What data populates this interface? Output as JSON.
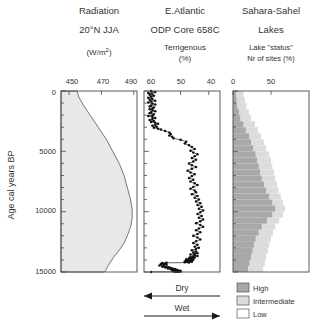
{
  "figure": {
    "yaxis_label": "Age cal years BP",
    "y_ticks": [
      "0",
      "5000",
      "10000",
      "15000"
    ],
    "annotations": {
      "dry": "Dry",
      "wet": "Wet"
    }
  },
  "panels": [
    {
      "id": "radiation",
      "title": "Radiation",
      "subtitle": "20°N JJA",
      "units": "(W/m",
      "units_sup": "2",
      "units_close": ")",
      "ticks": [
        "450",
        "470",
        "490"
      ]
    },
    {
      "id": "odp",
      "title": "E.Atlantic",
      "subtitle": "ODP Core 658C",
      "units": "Terrigenous",
      "units2": "(%)",
      "ticks": [
        "60",
        "50",
        "40"
      ]
    },
    {
      "id": "lakes",
      "title": "Sahara-Sahel",
      "subtitle": "Lakes",
      "units": "Lake \"status\"",
      "units2": "Nr of sites (%)",
      "ticks": [
        "0",
        "50"
      ]
    }
  ],
  "legend": {
    "items": [
      {
        "label": "High",
        "color": "#a8a8a8"
      },
      {
        "label": "Intermediate",
        "color": "#dcdcdc"
      },
      {
        "label": "Low",
        "color": "#ffffff"
      }
    ]
  },
  "chart_data": [
    {
      "type": "area",
      "title": "Radiation 20°N JJA",
      "xlabel": "(W/m2)",
      "ylabel": "Age cal years BP",
      "xlim": [
        445,
        492
      ],
      "ylim": [
        0,
        15000
      ],
      "xticks": [
        450,
        470,
        490
      ],
      "yticks": [
        0,
        5000,
        10000,
        15000
      ],
      "grid": false,
      "x": [
        455,
        456,
        459,
        463,
        468,
        473,
        477,
        481,
        484,
        486,
        488,
        489,
        489,
        488,
        486,
        484,
        481,
        478,
        476,
        474,
        473,
        472
      ],
      "y": [
        0,
        500,
        1200,
        2000,
        3000,
        4000,
        5000,
        6000,
        7000,
        8000,
        9000,
        9800,
        10600,
        11300,
        12000,
        12600,
        13200,
        13700,
        14100,
        14500,
        14800,
        15000
      ],
      "baseline": 445
    },
    {
      "type": "line",
      "title": "E.Atlantic ODP Core 658C Terrigenous",
      "xlabel": "Terrigenous (%)",
      "ylabel": "Age cal years BP",
      "xlim": [
        63,
        36
      ],
      "ylim": [
        0,
        15000
      ],
      "xticks": [
        60,
        50,
        40
      ],
      "yticks": [
        0,
        5000,
        10000,
        15000
      ],
      "grid": false,
      "reversed_x": true,
      "markers": true,
      "x": [
        60.5,
        59.0,
        61.5,
        60.0,
        61.0,
        59.5,
        60.5,
        61.5,
        60.0,
        61.0,
        59.0,
        60.5,
        61.5,
        60.0,
        59.0,
        60.5,
        61.0,
        59.5,
        60.0,
        61.0,
        60.0,
        59.0,
        60.5,
        61.0,
        59.5,
        60.0,
        61.5,
        60.0,
        59.0,
        60.0,
        61.0,
        59.5,
        60.5,
        59.0,
        58.0,
        59.0,
        60.0,
        58.5,
        59.5,
        58.0,
        57.0,
        55.5,
        54.0,
        53.5,
        54.0,
        53.0,
        52.5,
        50.0,
        48.0,
        48.5,
        47.0,
        46.0,
        45.0,
        46.5,
        45.5,
        44.0,
        45.0,
        46.0,
        44.5,
        45.5,
        47.0,
        46.0,
        44.5,
        46.0,
        47.5,
        46.5,
        45.0,
        46.0,
        47.0,
        45.5,
        46.5,
        45.0,
        44.0,
        45.5,
        46.5,
        45.0,
        44.5,
        46.0,
        44.0,
        45.0,
        43.5,
        44.5,
        43.0,
        44.0,
        42.5,
        43.5,
        42.0,
        43.0,
        44.0,
        42.5,
        43.5,
        42.0,
        43.0,
        44.5,
        43.0,
        42.0,
        43.5,
        44.5,
        43.0,
        44.0,
        45.5,
        44.0,
        43.0,
        44.5,
        45.5,
        44.0,
        45.0,
        43.5,
        44.5,
        46.0,
        44.5,
        45.5,
        44.0,
        45.0,
        46.5,
        45.0,
        44.0,
        45.5,
        46.5,
        45.0,
        46.0,
        47.0,
        45.5,
        46.5,
        48.0,
        46.5,
        45.5,
        47.0,
        48.0,
        46.5,
        47.5,
        46.0,
        47.0,
        48.5,
        47.0,
        46.0,
        47.5,
        48.5,
        47.0,
        55.0,
        56.5,
        55.5,
        57.0,
        55.0,
        56.0,
        57.5,
        56.0,
        55.0,
        56.5,
        54.0,
        55.5,
        54.5,
        53.0,
        54.5,
        53.5,
        52.0,
        53.5,
        52.5,
        51.5,
        53.0,
        52.0,
        51.0,
        52.5,
        51.5,
        50.5,
        52.0,
        51.0,
        50.0,
        51.5,
        52.5,
        51.0,
        50.0,
        51.5,
        50.5,
        52.0,
        60.5
      ],
      "y": [
        0,
        80,
        160,
        240,
        320,
        400,
        480,
        560,
        640,
        720,
        800,
        880,
        960,
        1040,
        1120,
        1200,
        1280,
        1360,
        1440,
        1520,
        1600,
        1680,
        1760,
        1840,
        1920,
        2000,
        2080,
        2160,
        2240,
        2320,
        2400,
        2480,
        2560,
        2640,
        2720,
        2800,
        2880,
        2960,
        3040,
        3120,
        3200,
        3320,
        3440,
        3560,
        3680,
        3800,
        3920,
        4050,
        4200,
        4350,
        4500,
        4650,
        4800,
        4950,
        5100,
        5250,
        5400,
        5550,
        5700,
        5850,
        6000,
        6150,
        6300,
        6450,
        6600,
        6750,
        6900,
        7050,
        7200,
        7350,
        7500,
        7650,
        7800,
        7950,
        8100,
        8250,
        8400,
        8550,
        8700,
        8850,
        9000,
        9150,
        9300,
        9450,
        9600,
        9750,
        9900,
        10050,
        10200,
        10350,
        10500,
        10650,
        10800,
        10950,
        11100,
        11250,
        11400,
        11550,
        11700,
        11850,
        12000,
        12150,
        12300,
        12450,
        12600,
        12750,
        12900,
        13000,
        13100,
        13200,
        13300,
        13380,
        13440,
        13500,
        13560,
        13620,
        13680,
        13720,
        13760,
        13800,
        13830,
        13860,
        13890,
        13920,
        13940,
        13960,
        13980,
        14000,
        14020,
        14040,
        14060,
        14080,
        14100,
        14120,
        14140,
        14160,
        14180,
        14200,
        14220,
        14240,
        14260,
        14300,
        14340,
        14380,
        14420,
        14460,
        14500,
        14540,
        14570,
        14600,
        14630,
        14660,
        14690,
        14710,
        14730,
        14750,
        14770,
        14790,
        14810,
        14830,
        14850,
        14860,
        14870,
        14880,
        14890,
        14900,
        14910,
        14920,
        14930,
        14940,
        14950,
        14960,
        14970,
        14980,
        14985,
        14990,
        14995,
        15000,
        15000
      ]
    },
    {
      "type": "bar",
      "title": "Sahara-Sahel Lakes — Lake status, Nr of sites (%)",
      "xlabel": "Nr of sites (%)",
      "ylabel": "Age cal years BP",
      "xlim": [
        0,
        100
      ],
      "ylim": [
        0,
        15000
      ],
      "xticks": [
        0,
        50
      ],
      "yticks": [
        0,
        5000,
        10000,
        15000
      ],
      "grid": false,
      "orientation": "horizontal",
      "stacked": true,
      "bin_size": 500,
      "bin_centers": [
        250,
        750,
        1250,
        1750,
        2250,
        2750,
        3250,
        3750,
        4250,
        4750,
        5250,
        5750,
        6250,
        6750,
        7250,
        7750,
        8250,
        8750,
        9250,
        9750,
        10250,
        10750,
        11250,
        11750,
        12250,
        12750,
        13250,
        13750,
        14250,
        14750
      ],
      "series": [
        {
          "name": "High",
          "color": "#a8a8a8",
          "values": [
            4,
            5,
            6,
            8,
            10,
            14,
            17,
            21,
            24,
            27,
            30,
            32,
            34,
            36,
            38,
            41,
            44,
            48,
            52,
            56,
            52,
            45,
            38,
            34,
            30,
            28,
            26,
            24,
            22,
            20
          ]
        },
        {
          "name": "Intermediate",
          "color": "#dcdcdc",
          "values": [
            10,
            11,
            12,
            13,
            14,
            15,
            16,
            16,
            17,
            17,
            18,
            18,
            18,
            18,
            18,
            17,
            16,
            15,
            14,
            13,
            14,
            16,
            18,
            19,
            20,
            20,
            20,
            20,
            20,
            20
          ]
        },
        {
          "name": "Low",
          "color": "#ffffff",
          "values": [
            86,
            84,
            82,
            79,
            76,
            71,
            67,
            63,
            59,
            56,
            52,
            50,
            48,
            46,
            44,
            42,
            40,
            37,
            34,
            31,
            34,
            39,
            44,
            47,
            50,
            52,
            54,
            56,
            58,
            60
          ]
        }
      ]
    }
  ]
}
